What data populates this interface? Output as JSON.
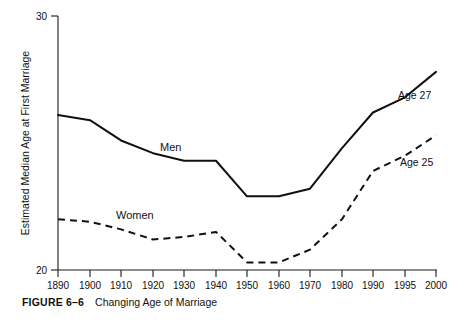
{
  "figure": {
    "number_label": "FIGURE 6–6",
    "caption_title": "Changing Age of Marriage"
  },
  "chart_data": {
    "type": "line",
    "title": "Changing Age of Marriage",
    "xlabel": "",
    "ylabel": "Estimated Median Age at First Marriage",
    "categories": [
      "1890",
      "1900",
      "1910",
      "1920",
      "1930",
      "1940",
      "1950",
      "1960",
      "1970",
      "1980",
      "1990",
      "1995",
      "2000"
    ],
    "x": [
      1890,
      1900,
      1910,
      1920,
      1930,
      1940,
      1950,
      1960,
      1970,
      1980,
      1990,
      1995,
      2000
    ],
    "xlim": [
      1890,
      2000
    ],
    "ylim": [
      20,
      30
    ],
    "yticks": [
      "20",
      "30"
    ],
    "ytick_values": [
      20,
      30
    ],
    "grid": false,
    "legend": "inline-labels",
    "series": [
      {
        "name": "Men",
        "style": "solid",
        "color": "#111111",
        "label_text": "Men",
        "end_label": "Age 27",
        "values": [
          26.1,
          25.9,
          25.1,
          24.6,
          24.3,
          24.3,
          22.9,
          22.9,
          23.2,
          24.8,
          26.2,
          26.8,
          27.8
        ]
      },
      {
        "name": "Women",
        "style": "dashed",
        "color": "#111111",
        "label_text": "Women",
        "end_label": "Age 25",
        "values": [
          22.0,
          21.9,
          21.6,
          21.2,
          21.3,
          21.5,
          20.3,
          20.3,
          20.8,
          22.0,
          23.9,
          24.5,
          25.3
        ]
      }
    ]
  },
  "labels": {
    "men_series": "Men",
    "women_series": "Women",
    "men_end": "Age 27",
    "women_end": "Age 25"
  }
}
